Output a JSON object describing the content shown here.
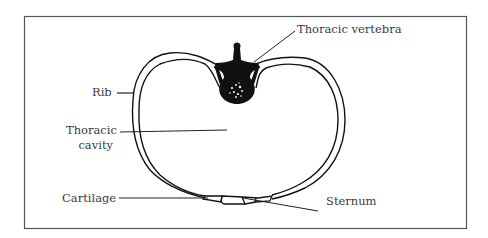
{
  "figure": {
    "type": "anatomical-cross-section",
    "frame_color": "#555555",
    "stroke_color": "#111111",
    "labels": [
      {
        "id": "thoracic-vertebra",
        "text": "Thoracic vertebra"
      },
      {
        "id": "rib",
        "text": "Rib"
      },
      {
        "id": "thoracic-cavity-line1",
        "text": "Thoracic"
      },
      {
        "id": "thoracic-cavity-line2",
        "text": "cavity"
      },
      {
        "id": "cartilage",
        "text": "Cartilage"
      },
      {
        "id": "sternum",
        "text": "Sternum"
      }
    ]
  }
}
